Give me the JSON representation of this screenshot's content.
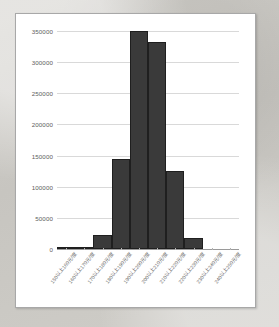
{
  "chart_data": {
    "type": "bar",
    "title": "",
    "xlabel": "",
    "ylabel": "",
    "categories": [
      "150以上160元/度",
      "160以上170元/度",
      "170以上180元/度",
      "180以上190元/度",
      "190以上200元/度",
      "200以上210元/度",
      "210以上220元/度",
      "220以上230元/度",
      "230以上240元/度",
      "240以上250元/度"
    ],
    "values": [
      900,
      1200,
      23000,
      145000,
      350000,
      332000,
      126000,
      18000,
      0,
      0
    ],
    "ylim": [
      0,
      350000
    ],
    "yticks": [
      0,
      50000,
      100000,
      150000,
      200000,
      250000,
      300000,
      350000
    ],
    "ytick_labels": [
      "0",
      "50000",
      "100000",
      "150000",
      "200000",
      "250000",
      "300000",
      "350000"
    ],
    "grid": true,
    "legend": false,
    "bar_color": "#3a3a3a",
    "bar_edge_color": "#1f1f1f",
    "gridline_color": "#d9d9d9",
    "axis_color": "#9a9a9a",
    "plot_background": "#ffffff",
    "panel_border_color": "#a8a8a8",
    "page_background": "#cbc9c4"
  }
}
